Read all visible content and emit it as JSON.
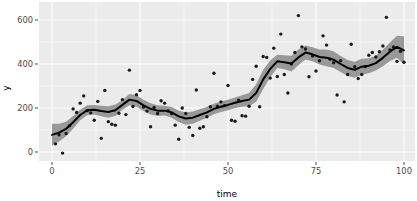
{
  "chart_data": {
    "type": "scatter",
    "title": "",
    "subtitle": "",
    "xlabel": "time",
    "ylabel": "y",
    "xlim": [
      -1,
      102
    ],
    "ylim": [
      -60,
      660
    ],
    "grid": true,
    "legend": null,
    "x_ticks": [
      0,
      25,
      50,
      75,
      100
    ],
    "y_ticks": [
      0,
      200,
      400,
      600
    ],
    "x_tick_labels": [
      "0",
      "25",
      "50",
      "75",
      "100"
    ],
    "y_tick_labels": [
      "0",
      "200",
      "400",
      "600"
    ],
    "colors": {
      "panel_background": "#EBEBEB",
      "gridline": "#FFFFFF",
      "point": "#1A1A1A",
      "smooth_line": "#000000",
      "confidence_ribbon": "#999999",
      "axis_text": "#4D4D4D",
      "plot_background": "#FFFFFF"
    },
    "series": [
      {
        "name": "observations",
        "type": "scatter",
        "x": [
          1,
          2,
          3,
          4,
          5,
          6,
          7,
          8,
          9,
          10,
          11,
          12,
          13,
          14,
          15,
          16,
          17,
          18,
          19,
          20,
          21,
          22,
          23,
          24,
          25,
          26,
          27,
          28,
          29,
          30,
          31,
          32,
          33,
          34,
          35,
          36,
          37,
          38,
          39,
          40,
          41,
          42,
          43,
          44,
          45,
          46,
          47,
          48,
          49,
          50,
          51,
          52,
          53,
          54,
          55,
          56,
          57,
          58,
          59,
          60,
          61,
          62,
          63,
          64,
          65,
          66,
          67,
          68,
          69,
          70,
          71,
          72,
          73,
          74,
          75,
          76,
          77,
          78,
          79,
          80,
          81,
          82,
          83,
          84,
          85,
          86,
          87,
          88,
          89,
          90,
          91,
          92,
          93,
          94,
          95,
          96,
          97,
          98,
          99,
          100
        ],
        "y": [
          37,
          78,
          -5,
          84,
          120,
          196,
          180,
          222,
          255,
          188,
          178,
          144,
          230,
          62,
          280,
          138,
          126,
          122,
          176,
          238,
          170,
          372,
          207,
          260,
          280,
          204,
          186,
          115,
          202,
          175,
          233,
          222,
          187,
          175,
          122,
          58,
          200,
          175,
          112,
          75,
          282,
          108,
          115,
          160,
          206,
          358,
          208,
          228,
          211,
          302,
          144,
          140,
          236,
          165,
          163,
          208,
          330,
          390,
          206,
          434,
          430,
          336,
          472,
          343,
          536,
          352,
          268,
          400,
          452,
          620,
          478,
          468,
          342,
          436,
          368,
          415,
          528,
          486,
          422,
          406,
          259,
          415,
          228,
          352,
          490,
          388,
          334,
          352,
          388,
          440,
          452,
          432,
          456,
          482,
          612,
          464,
          478,
          412,
          458,
          408
        ],
        "point_size": 1.7
      },
      {
        "name": "loess-smooth",
        "type": "line",
        "x": [
          0,
          2,
          4,
          6,
          8,
          10,
          12,
          14,
          16,
          18,
          20,
          22,
          24,
          26,
          28,
          30,
          32,
          34,
          36,
          38,
          40,
          42,
          44,
          46,
          48,
          50,
          52,
          54,
          56,
          58,
          60,
          62,
          64,
          66,
          68,
          70,
          72,
          74,
          76,
          78,
          80,
          82,
          84,
          86,
          88,
          90,
          92,
          94,
          96,
          98,
          100
        ],
        "y": [
          78,
          88,
          105,
          135,
          168,
          190,
          192,
          186,
          182,
          190,
          214,
          238,
          232,
          212,
          196,
          188,
          188,
          180,
          162,
          152,
          156,
          168,
          180,
          196,
          206,
          214,
          224,
          232,
          238,
          268,
          330,
          378,
          412,
          408,
          402,
          430,
          452,
          444,
          432,
          428,
          420,
          400,
          382,
          374,
          388,
          392,
          404,
          428,
          456,
          478,
          462
        ],
        "ribbon_lower": [
          28,
          48,
          72,
          106,
          144,
          168,
          170,
          162,
          156,
          164,
          192,
          212,
          206,
          186,
          170,
          164,
          166,
          156,
          136,
          124,
          128,
          142,
          156,
          172,
          182,
          190,
          200,
          206,
          208,
          228,
          286,
          340,
          382,
          376,
          366,
          394,
          420,
          412,
          398,
          390,
          382,
          364,
          346,
          338,
          352,
          358,
          370,
          390,
          414,
          428,
          398
        ],
        "ribbon_upper": [
          128,
          128,
          138,
          164,
          192,
          212,
          214,
          210,
          208,
          216,
          236,
          264,
          258,
          238,
          222,
          212,
          210,
          204,
          188,
          180,
          184,
          194,
          204,
          220,
          230,
          238,
          248,
          258,
          268,
          308,
          374,
          416,
          442,
          440,
          438,
          466,
          484,
          476,
          466,
          466,
          458,
          436,
          418,
          410,
          424,
          426,
          438,
          466,
          498,
          528,
          526
        ]
      }
    ]
  },
  "layout": {
    "panel": {
      "left": 39,
      "top": 2,
      "right": 415,
      "bottom": 161
    },
    "x_scale": {
      "px_at_min": 52,
      "px_at_max": 404,
      "data_min": 0,
      "data_max": 100
    },
    "y_scale": {
      "px_at_min": 152,
      "px_at_max": 20,
      "data_min": 0,
      "data_max": 600
    },
    "minor_gridlines_y": [
      100,
      300,
      500
    ],
    "minor_gridlines_x": [
      12.5,
      37.5,
      62.5,
      87.5
    ]
  }
}
